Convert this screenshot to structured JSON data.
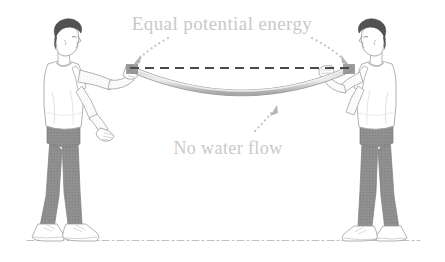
{
  "figure": {
    "background_color": "#ffffff"
  },
  "labels": {
    "top_label": "Equal potential energy",
    "bottom_label": "No water flow"
  },
  "colors": {
    "label_text": "#c9c9c9",
    "dashed_level_line": "#4a4a4a",
    "hose": "#b9b9b9",
    "hose_shade": "#9a9a9a",
    "leader_dots": "#bdbdbd",
    "ground_line": "#bdbdbd",
    "hair": "#4f4f4f",
    "skin_outline": "#9b9b9b",
    "shirt": "#ffffff",
    "shirt_outline": "#a8a8a8",
    "pants": "#8f8f8f",
    "shoes": "#ffffff",
    "shoe_outline": "#9e9e9e"
  },
  "geometry": {
    "hose_left_end": {
      "x": 131,
      "y": 68
    },
    "hose_right_end": {
      "x": 350,
      "y": 68
    },
    "hose_lowest_point": {
      "x": 243,
      "y": 101
    },
    "level_line_y": 68,
    "ground_line_y": 240
  },
  "figures": [
    {
      "name": "person-left",
      "facing": "right",
      "hair_color": "#4f4f4f",
      "shirt": "white t-shirt",
      "pants": "gray trousers",
      "shoes": "white sneakers"
    },
    {
      "name": "person-right",
      "facing": "left",
      "hair_color": "#4f4f4f",
      "shirt": "white t-shirt",
      "pants": "gray trousers",
      "shoes": "white sneakers"
    }
  ],
  "annotations": [
    {
      "name": "top-leader-left",
      "description": "dotted leader from top label down-left to left hose end",
      "arrow_direction": "down-left"
    },
    {
      "name": "top-leader-right",
      "description": "dotted leader from top label down-right to right hose end",
      "arrow_direction": "down-right"
    },
    {
      "name": "bottom-leader",
      "description": "dotted leader from bottom label up-right to hose low point",
      "arrow_direction": "up-right"
    }
  ]
}
